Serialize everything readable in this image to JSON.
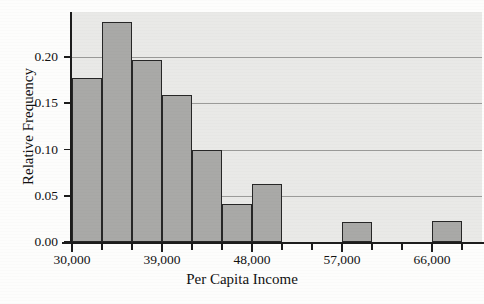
{
  "chart_data": {
    "type": "bar",
    "title": "",
    "xlabel": "Per Capita Income",
    "ylabel": "Relative Frequency",
    "categories": [
      "30,000-33,000",
      "33,000-36,000",
      "36,000-39,000",
      "39,000-42,000",
      "42,000-45,000",
      "45,000-48,000",
      "48,000-51,000",
      "51,000-54,000",
      "54,000-57,000",
      "57,000-60,000",
      "60,000-63,000",
      "63,000-66,000",
      "66,000-69,000"
    ],
    "values": [
      0.177,
      0.238,
      0.197,
      0.159,
      0.1,
      0.041,
      0.063,
      0.0,
      0.0,
      0.022,
      0.0,
      0.0,
      0.023
    ],
    "bin_width": 3000,
    "bin_start": 30000,
    "xlim": [
      30000,
      72000
    ],
    "ylim": [
      0.0,
      0.25
    ],
    "grid": true,
    "legend": false,
    "y_ticks": [
      0.0,
      0.05,
      0.1,
      0.15,
      0.2
    ],
    "y_tick_labels": [
      "0.00",
      "0.05",
      "0.10",
      "0.15",
      "0.20"
    ],
    "x_tick_labels": [
      "30,000",
      "39,000",
      "48,000",
      "57,000",
      "66,000"
    ],
    "x_tick_values": [
      30000,
      39000,
      48000,
      57000,
      66000
    ],
    "bar_fill_color": "#a9a9a7",
    "bar_edge_color": "#262626",
    "panel_color": "#e9e9e7",
    "grid_color": "#9b9b99",
    "axis_color": "#1c1c1c"
  },
  "axes": {
    "y_title": "Relative Frequency",
    "x_title": "Per Capita Income"
  }
}
